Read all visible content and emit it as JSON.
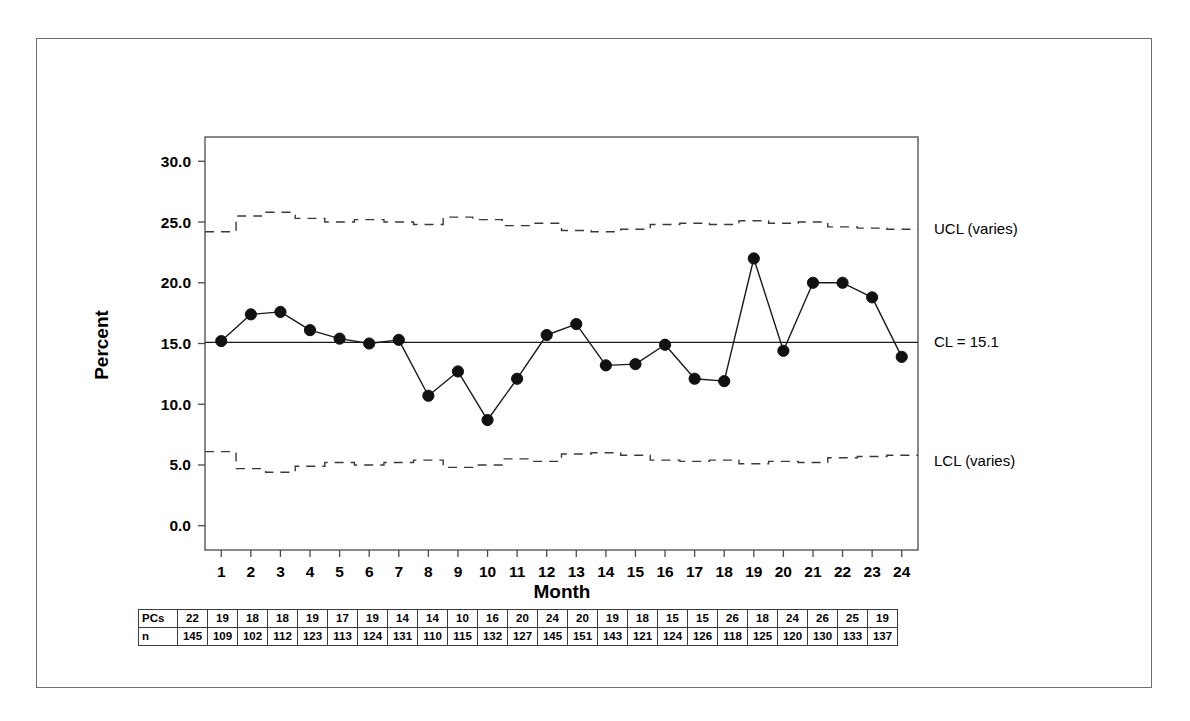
{
  "chart_data": {
    "type": "line",
    "title": "",
    "subtitle": "",
    "xlabel": "Month",
    "ylabel": "Percent",
    "x": [
      1,
      2,
      3,
      4,
      5,
      6,
      7,
      8,
      9,
      10,
      11,
      12,
      13,
      14,
      15,
      16,
      17,
      18,
      19,
      20,
      21,
      22,
      23,
      24
    ],
    "xticklabels": [
      "1",
      "2",
      "3",
      "4",
      "5",
      "6",
      "7",
      "8",
      "9",
      "10",
      "11",
      "12",
      "13",
      "14",
      "15",
      "16",
      "17",
      "18",
      "19",
      "20",
      "21",
      "22",
      "23",
      "24"
    ],
    "yticklabels": [
      "0.0",
      "5.0",
      "10.0",
      "15.0",
      "20.0",
      "25.0",
      "30.0"
    ],
    "yticks": [
      0.0,
      5.0,
      10.0,
      15.0,
      20.0,
      25.0,
      30.0
    ],
    "ylim": [
      -2.0,
      32.0
    ],
    "xlim": [
      0.45,
      24.55
    ],
    "grid": false,
    "legend": false,
    "series": [
      {
        "name": "Percent",
        "marker": "filled-circle",
        "values": [
          15.2,
          17.4,
          17.6,
          16.1,
          15.4,
          15.0,
          15.3,
          10.7,
          12.7,
          8.7,
          12.1,
          15.7,
          16.6,
          13.2,
          13.3,
          14.9,
          12.1,
          11.9,
          22.0,
          14.4,
          20.0,
          20.0,
          18.8,
          13.9
        ]
      },
      {
        "name": "UCL (varies)",
        "style": "dashed-step",
        "values": [
          24.2,
          25.5,
          25.8,
          25.3,
          25.0,
          25.2,
          25.0,
          24.8,
          25.4,
          25.2,
          24.7,
          24.9,
          24.3,
          24.2,
          24.4,
          24.8,
          24.9,
          24.8,
          25.1,
          24.9,
          25.0,
          24.6,
          24.5,
          24.4
        ]
      },
      {
        "name": "CL",
        "style": "solid",
        "value": 15.1
      },
      {
        "name": "LCL (varies)",
        "style": "dashed-step",
        "values": [
          6.1,
          4.7,
          4.4,
          4.9,
          5.2,
          5.0,
          5.2,
          5.4,
          4.8,
          5.0,
          5.5,
          5.3,
          5.9,
          6.0,
          5.8,
          5.4,
          5.3,
          5.4,
          5.1,
          5.3,
          5.2,
          5.6,
          5.7,
          5.8
        ]
      }
    ],
    "annotations": [
      {
        "name": "ucl-label",
        "text": "UCL (varies)",
        "value": 24.4
      },
      {
        "name": "cl-label",
        "text": "CL = 15.1",
        "value": 15.1
      },
      {
        "name": "lcl-label",
        "text": "LCL (varies)",
        "value": 5.3
      }
    ],
    "center_line_value": 15.1,
    "table": {
      "rows": [
        {
          "label": "PCs",
          "values": [
            22,
            19,
            18,
            18,
            19,
            17,
            19,
            14,
            14,
            10,
            16,
            20,
            24,
            20,
            19,
            18,
            15,
            15,
            26,
            18,
            24,
            26,
            25,
            19
          ]
        },
        {
          "label": "n",
          "values": [
            145,
            109,
            102,
            112,
            123,
            113,
            124,
            131,
            110,
            115,
            132,
            127,
            145,
            151,
            143,
            121,
            124,
            126,
            118,
            125,
            120,
            130,
            133,
            137
          ]
        }
      ]
    }
  },
  "colors": {
    "line": "#1a1a1a",
    "marker": "#111111",
    "axis": "#4a4a4a",
    "control_limit": "#3a3a3a",
    "frame": "#6f6f6f",
    "text": "#000000"
  }
}
